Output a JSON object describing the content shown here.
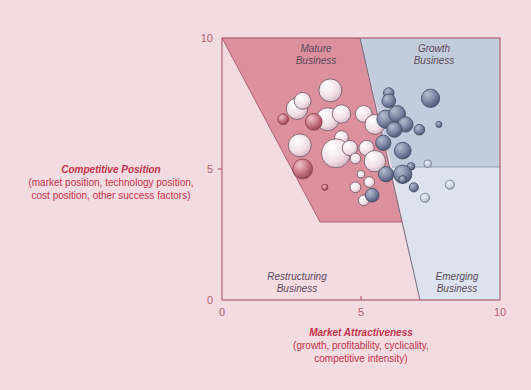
{
  "chart_data": {
    "type": "scatter",
    "subtype": "bubble",
    "title": "",
    "xlabel": "Market Attractiveness",
    "xlabel_sub": "(growth, profitability, cyclicality, competitive intensity)",
    "ylabel": "Competitive Position",
    "ylabel_sub": "(market position, technology position, cost position, other success factors)",
    "xlim": [
      0,
      10
    ],
    "ylim": [
      0,
      10
    ],
    "x_ticks": [
      "0",
      "5",
      "10"
    ],
    "y_ticks": [
      "0",
      "5",
      "10"
    ],
    "grid": false,
    "regions": [
      {
        "name": "Mature Business",
        "color": "#d98b99",
        "polygon": [
          [
            0,
            10
          ],
          [
            5,
            10
          ],
          [
            6.5,
            3
          ],
          [
            3.5,
            3
          ]
        ]
      },
      {
        "name": "Growth Business",
        "color": "#b9c4d6",
        "polygon": [
          [
            5,
            10
          ],
          [
            10,
            10
          ],
          [
            10,
            5
          ],
          [
            7.3,
            5
          ]
        ]
      },
      {
        "name": "Emerging Business",
        "color": "#d9e0ec",
        "polygon": [
          [
            7.3,
            5
          ],
          [
            10,
            5
          ],
          [
            10,
            0
          ],
          [
            7.2,
            0
          ]
        ]
      },
      {
        "name": "Restructuring Business",
        "color": "#f3dbe2",
        "polygon": [
          [
            0,
            0
          ],
          [
            0,
            10
          ],
          [
            3.5,
            3
          ],
          [
            6.5,
            3
          ],
          [
            7.2,
            0
          ]
        ]
      }
    ],
    "series": [
      {
        "name": "Mature (light pink bubbles)",
        "color": "#f4e6ec",
        "points": [
          {
            "x": 3.9,
            "y": 8.0,
            "r": 0.75
          },
          {
            "x": 2.7,
            "y": 7.3,
            "r": 0.7
          },
          {
            "x": 2.9,
            "y": 7.6,
            "r": 0.55
          },
          {
            "x": 3.8,
            "y": 6.9,
            "r": 0.75
          },
          {
            "x": 4.3,
            "y": 7.1,
            "r": 0.6
          },
          {
            "x": 5.1,
            "y": 7.1,
            "r": 0.55
          },
          {
            "x": 5.5,
            "y": 6.7,
            "r": 0.65
          },
          {
            "x": 4.3,
            "y": 6.2,
            "r": 0.45
          },
          {
            "x": 2.8,
            "y": 5.9,
            "r": 0.75
          },
          {
            "x": 4.1,
            "y": 5.6,
            "r": 0.95
          },
          {
            "x": 4.6,
            "y": 5.8,
            "r": 0.5
          },
          {
            "x": 4.8,
            "y": 5.4,
            "r": 0.35
          },
          {
            "x": 5.2,
            "y": 5.8,
            "r": 0.5
          },
          {
            "x": 5.5,
            "y": 5.3,
            "r": 0.7
          },
          {
            "x": 5.0,
            "y": 4.8,
            "r": 0.25
          },
          {
            "x": 4.8,
            "y": 4.3,
            "r": 0.35
          },
          {
            "x": 5.3,
            "y": 4.5,
            "r": 0.35
          },
          {
            "x": 5.1,
            "y": 3.8,
            "r": 0.35
          }
        ]
      },
      {
        "name": "Mature (dark pink bubbles)",
        "color": "#c77583",
        "points": [
          {
            "x": 2.2,
            "y": 6.9,
            "r": 0.35
          },
          {
            "x": 3.3,
            "y": 6.8,
            "r": 0.55
          },
          {
            "x": 2.9,
            "y": 5.0,
            "r": 0.65
          },
          {
            "x": 3.7,
            "y": 4.3,
            "r": 0.2
          }
        ]
      },
      {
        "name": "Growth (slate blue bubbles)",
        "color": "#7c86a3",
        "points": [
          {
            "x": 6.0,
            "y": 7.9,
            "r": 0.35
          },
          {
            "x": 6.0,
            "y": 7.6,
            "r": 0.45
          },
          {
            "x": 7.5,
            "y": 7.7,
            "r": 0.6
          },
          {
            "x": 5.9,
            "y": 6.9,
            "r": 0.6
          },
          {
            "x": 6.3,
            "y": 7.1,
            "r": 0.55
          },
          {
            "x": 6.6,
            "y": 6.7,
            "r": 0.5
          },
          {
            "x": 6.2,
            "y": 6.5,
            "r": 0.5
          },
          {
            "x": 7.1,
            "y": 6.5,
            "r": 0.35
          },
          {
            "x": 5.8,
            "y": 6.0,
            "r": 0.5
          },
          {
            "x": 6.5,
            "y": 5.7,
            "r": 0.55
          },
          {
            "x": 6.8,
            "y": 5.1,
            "r": 0.25
          },
          {
            "x": 6.5,
            "y": 4.8,
            "r": 0.6
          },
          {
            "x": 5.9,
            "y": 4.8,
            "r": 0.5
          },
          {
            "x": 6.5,
            "y": 4.6,
            "r": 0.25
          },
          {
            "x": 5.4,
            "y": 4.0,
            "r": 0.45
          },
          {
            "x": 7.8,
            "y": 6.7,
            "r": 0.2
          },
          {
            "x": 6.9,
            "y": 4.3,
            "r": 0.3
          }
        ]
      },
      {
        "name": "Emerging (light blue bubbles)",
        "color": "#c9d0de",
        "points": [
          {
            "x": 7.4,
            "y": 5.2,
            "r": 0.25
          },
          {
            "x": 8.2,
            "y": 4.4,
            "r": 0.3
          },
          {
            "x": 7.3,
            "y": 3.9,
            "r": 0.3
          }
        ]
      }
    ],
    "annotations": [
      {
        "text": "Mature Business",
        "x": 3.4,
        "y": 9.5
      },
      {
        "text": "Growth Business",
        "x": 7.5,
        "y": 9.5
      },
      {
        "text": "Restructuring Business",
        "x": 2.7,
        "y": 1.0
      },
      {
        "text": "Emerging Business",
        "x": 8.5,
        "y": 1.0
      }
    ]
  },
  "labels": {
    "y_title": "Competitive Position",
    "y_sub1": "(market position, technology position,",
    "y_sub2": "cost position, other success factors)",
    "x_title": "Market Attractiveness",
    "x_sub1": "(growth, profitability, cyclicality,",
    "x_sub2": "competitive intensity)",
    "tick_x0": "0",
    "tick_x5": "5",
    "tick_x10": "10",
    "tick_y0": "0",
    "tick_y5": "5",
    "tick_y10": "10",
    "mature_1": "Mature",
    "mature_2": "Business",
    "growth_1": "Growth",
    "growth_2": "Business",
    "restructuring_1": "Restructuring",
    "restructuring_2": "Business",
    "emerging_1": "Emerging",
    "emerging_2": "Business"
  }
}
